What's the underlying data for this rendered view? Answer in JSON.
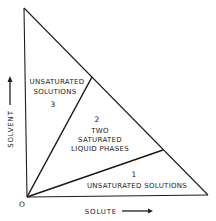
{
  "diagram": {
    "type": "ternary-phase-triangle",
    "origin_label": "O",
    "axes": {
      "x_label": "SOLUTE",
      "y_label": "SOLVENT"
    },
    "regions": [
      {
        "number": "3",
        "lines": [
          "UNSATURATED",
          "SOLUTIONS"
        ]
      },
      {
        "number": "2",
        "lines": [
          "TWO",
          "SATURATED",
          "LIQUID PHASES"
        ]
      },
      {
        "number": "1",
        "lines": [
          "UNSATURATED SOLUTIONS"
        ]
      }
    ],
    "colors": {
      "line": "#1e1e1e",
      "background": "#ffffff"
    }
  }
}
